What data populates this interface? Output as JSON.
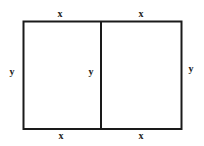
{
  "diagram": {
    "stroke_color": "#1a1a1a",
    "labels": {
      "top_left": "x",
      "top_right": "x",
      "bottom_left": "x",
      "bottom_right": "x",
      "left": "y",
      "middle": "y",
      "right": "y"
    }
  }
}
